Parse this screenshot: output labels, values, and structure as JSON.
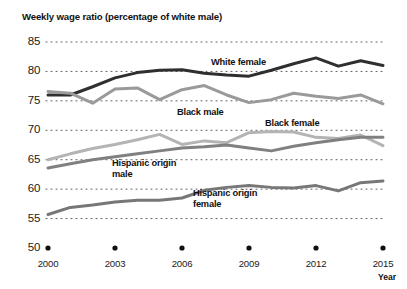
{
  "chart_data": {
    "type": "line",
    "title": "Weekly wage ratio (percentage of white male)",
    "xlabel": "Year",
    "ylabel": "",
    "xlim": [
      2000,
      2015
    ],
    "ylim": [
      50,
      85
    ],
    "grid": "dotted-horizontal",
    "legend_position": "inline-annotations",
    "x": [
      2000,
      2001,
      2002,
      2003,
      2004,
      2005,
      2006,
      2007,
      2008,
      2009,
      2010,
      2011,
      2012,
      2013,
      2014,
      2015
    ],
    "y_ticks": [
      50,
      55,
      60,
      65,
      70,
      75,
      80,
      85
    ],
    "x_ticks": [
      2000,
      2003,
      2006,
      2009,
      2012,
      2015
    ],
    "series": [
      {
        "name": "White female",
        "color": "#2f2f2f",
        "width": 3.0,
        "values": [
          76.0,
          76.0,
          77.4,
          78.9,
          79.8,
          80.2,
          80.3,
          79.7,
          79.4,
          79.2,
          80.2,
          81.3,
          82.3,
          80.9,
          81.8,
          81.0
        ]
      },
      {
        "name": "Black male",
        "color": "#9a9a9a",
        "width": 3.0,
        "values": [
          76.6,
          76.3,
          74.6,
          77.0,
          77.2,
          75.2,
          76.9,
          77.6,
          76.0,
          74.7,
          75.2,
          76.3,
          75.8,
          75.4,
          76.0,
          74.5
        ]
      },
      {
        "name": "Black female",
        "color": "#b4b4b4",
        "width": 3.0,
        "values": [
          65.0,
          66.0,
          66.9,
          67.6,
          68.4,
          69.3,
          67.6,
          68.2,
          67.9,
          69.6,
          69.8,
          69.7,
          68.8,
          68.6,
          69.2,
          67.4
        ]
      },
      {
        "name": "Hispanic origin male",
        "color": "#808080",
        "width": 3.0,
        "values": [
          63.6,
          64.3,
          65.0,
          65.5,
          66.0,
          66.5,
          67.0,
          67.2,
          67.5,
          67.0,
          66.5,
          67.3,
          67.9,
          68.4,
          68.8,
          68.8
        ]
      },
      {
        "name": "Hispanic origin female",
        "color": "#777777",
        "width": 3.0,
        "values": [
          55.7,
          56.9,
          57.3,
          57.8,
          58.1,
          58.1,
          58.5,
          59.8,
          60.3,
          60.6,
          60.3,
          60.2,
          60.6,
          59.7,
          61.1,
          61.4
        ]
      }
    ],
    "annotations": [
      {
        "text": "White female",
        "x_px": 211,
        "y_px": 57
      },
      {
        "text": "Black male",
        "x_px": 177,
        "y_px": 107
      },
      {
        "text": "Black female",
        "x_px": 265,
        "y_px": 118
      },
      {
        "text": "Hispanic origin\nmale",
        "x_px": 112,
        "y_px": 158
      },
      {
        "text": "Hispanic origin\nfemale",
        "x_px": 193,
        "y_px": 188
      }
    ]
  },
  "axis": {
    "y_labels": [
      "85",
      "80",
      "75",
      "70",
      "65",
      "60",
      "55",
      "50"
    ],
    "x_labels": [
      "2000",
      "2003",
      "2006",
      "2009",
      "2012",
      "2015"
    ],
    "x_title": "Year"
  }
}
